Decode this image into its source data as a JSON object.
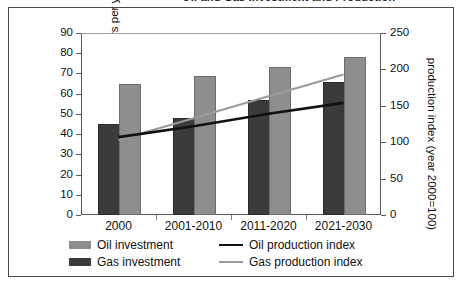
{
  "title": {
    "text": "Oil and Gas Investment and Production",
    "note": "cropped at top edge of screenshot"
  },
  "chart_data": {
    "type": "bar",
    "title": "Oil and Gas Investment and Production",
    "categories": [
      "2000",
      "2001-2010",
      "2011-2020",
      "2021-2030"
    ],
    "xlabel": "",
    "ylabel": "billion dollars per year",
    "ylim": [
      0,
      90
    ],
    "yticks": [
      0,
      10,
      20,
      30,
      40,
      50,
      60,
      70,
      80,
      90
    ],
    "y2label": "production index (year 2000=100)",
    "y2lim": [
      0,
      250
    ],
    "y2ticks": [
      0,
      50,
      100,
      150,
      200,
      250
    ],
    "grid": false,
    "legend_position": "bottom",
    "series": [
      {
        "name": "Oil investment",
        "kind": "bar",
        "axis": "left",
        "color": "#8e8e8e",
        "values": [
          64,
          68,
          72,
          77
        ]
      },
      {
        "name": "Gas investment",
        "kind": "bar",
        "axis": "left",
        "color": "#3b3b3b",
        "values": [
          44,
          47,
          56,
          65
        ]
      },
      {
        "name": "Oil production index",
        "kind": "line",
        "axis": "right",
        "color": "#111111",
        "values": [
          107,
          122,
          139,
          154
        ]
      },
      {
        "name": "Gas production index",
        "kind": "line",
        "axis": "right",
        "color": "#9a9a9a",
        "values": [
          103,
          133,
          163,
          193
        ]
      }
    ]
  },
  "axes": {
    "left_ticks": [
      "90",
      "80",
      "70",
      "60",
      "50",
      "40",
      "30",
      "20",
      "10",
      "0"
    ],
    "right_ticks": [
      "250",
      "200",
      "150",
      "100",
      "50",
      "0"
    ],
    "left_title": "billion dollars per year",
    "right_title": "production index (year 2000=100)"
  },
  "legend": {
    "items": [
      {
        "label": "Oil investment",
        "marker": "bar-swatch-light"
      },
      {
        "label": "Oil production index",
        "marker": "line-swatch-black"
      },
      {
        "label": "Gas investment",
        "marker": "bar-swatch-dark"
      },
      {
        "label": "Gas production index",
        "marker": "line-swatch-gray"
      }
    ]
  }
}
